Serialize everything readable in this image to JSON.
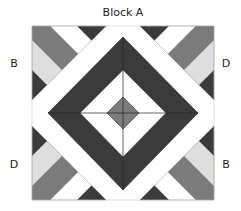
{
  "title": "Block A",
  "corner_labels": {
    "top_left": "B",
    "top_right": "D",
    "bottom_left": "D",
    "bottom_right": "B"
  },
  "colors": {
    "dark": "#3b3b3b",
    "mid_gray": "#7b7b7b",
    "light_gray": "#dedede",
    "white": "#ffffff",
    "outline": "#555555"
  },
  "pieces": {
    "outer_diamond": "dark gray frame",
    "inner_diamond": "white with cross seams",
    "center_diamond": "mid gray",
    "corner_units": [
      "B (top-left)",
      "D (top-right)",
      "D (bottom-left)",
      "B (bottom-right)"
    ],
    "corner_stripe_order": [
      "dark",
      "light_gray",
      "mid_gray",
      "white",
      "dark"
    ]
  }
}
